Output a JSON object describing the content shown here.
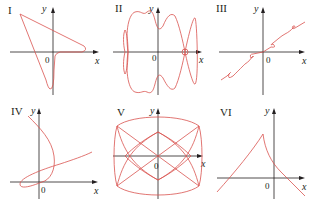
{
  "figure": {
    "curve_color": "#d9534f",
    "axis_color": "#231f20",
    "panels": [
      {
        "id": "I",
        "label": "I",
        "x_label": "x",
        "y_label": "y",
        "origin_label": "0"
      },
      {
        "id": "II",
        "label": "II",
        "x_label": "x",
        "y_label": "y",
        "origin_label": "0"
      },
      {
        "id": "III",
        "label": "III",
        "x_label": "x",
        "y_label": "y",
        "origin_label": "0"
      },
      {
        "id": "IV",
        "label": "IV",
        "x_label": "x",
        "y_label": "y",
        "origin_label": "0"
      },
      {
        "id": "V",
        "label": "V",
        "x_label": "x",
        "y_label": "y",
        "origin_label": "0"
      },
      {
        "id": "VI",
        "label": "VI",
        "x_label": "x",
        "y_label": "y",
        "origin_label": "0"
      }
    ]
  }
}
